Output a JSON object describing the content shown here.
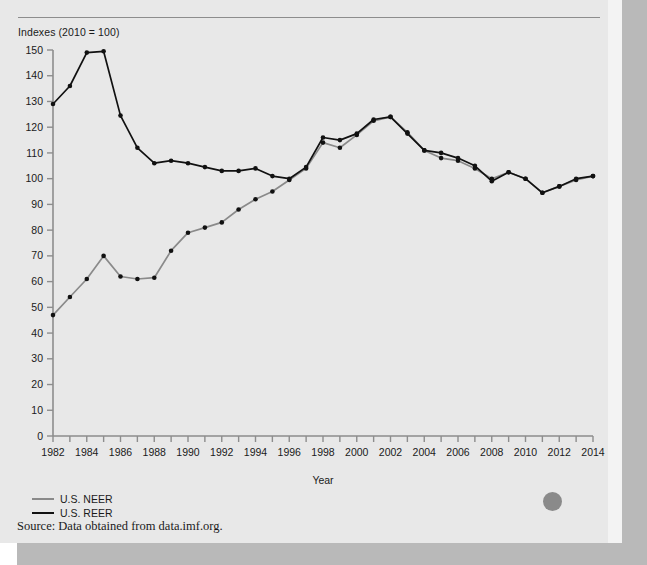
{
  "figure": {
    "axis_note": "Indexes (2010 = 100)",
    "source": "Source: Data obtained from data.imf.org."
  },
  "legend": {
    "position": "bottom-left",
    "items": [
      {
        "label": "U.S. NEER",
        "color": "#8a8a8a"
      },
      {
        "label": "U.S. REER",
        "color": "#111111"
      }
    ]
  },
  "chart_data": {
    "type": "line",
    "title": "Indexes (2010 = 100)",
    "subtitle": "",
    "xlabel": "Year",
    "ylabel": "Indexes (2010 = 100)",
    "xlim": [
      1982,
      2014
    ],
    "ylim": [
      0,
      150
    ],
    "ytick_step": 10,
    "xtick_step": 1,
    "xtick_label_step": 2,
    "grid": false,
    "markers": true,
    "yticks": [
      0,
      10,
      20,
      30,
      40,
      50,
      60,
      70,
      80,
      90,
      100,
      110,
      120,
      130,
      140,
      150
    ],
    "xticks": [
      1982,
      1983,
      1984,
      1985,
      1986,
      1987,
      1988,
      1989,
      1990,
      1991,
      1992,
      1993,
      1994,
      1995,
      1996,
      1997,
      1998,
      1999,
      2000,
      2001,
      2002,
      2003,
      2004,
      2005,
      2006,
      2007,
      2008,
      2009,
      2010,
      2011,
      2012,
      2013,
      2014
    ],
    "xtick_labels": [
      "1982",
      "",
      "1984",
      "",
      "1986",
      "",
      "1988",
      "",
      "1990",
      "",
      "1992",
      "",
      "1994",
      "",
      "1996",
      "",
      "1998",
      "",
      "2000",
      "",
      "2002",
      "",
      "2004",
      "",
      "2006",
      "",
      "2008",
      "",
      "2010",
      "",
      "2012",
      "",
      "2014"
    ],
    "x": [
      1982,
      1983,
      1984,
      1985,
      1986,
      1987,
      1988,
      1989,
      1990,
      1991,
      1992,
      1993,
      1994,
      1995,
      1996,
      1997,
      1998,
      1999,
      2000,
      2001,
      2002,
      2003,
      2004,
      2005,
      2006,
      2007,
      2008,
      2009,
      2010,
      2011,
      2012,
      2013,
      2014
    ],
    "series": [
      {
        "name": "U.S. NEER",
        "color": "#8a8a8a",
        "values": [
          47,
          54,
          61,
          70,
          62,
          61,
          61.5,
          72,
          79,
          81,
          83,
          88,
          92,
          95,
          99.5,
          104,
          114,
          112,
          117,
          122.5,
          124,
          118,
          111,
          108,
          107,
          104,
          100,
          102.5,
          100,
          94.5,
          97,
          99.5,
          101
        ]
      },
      {
        "name": "U.S. REER",
        "color": "#111111",
        "values": [
          129,
          136,
          149,
          149.5,
          124.5,
          112,
          106,
          107,
          106,
          104.5,
          103,
          103,
          104,
          101,
          100,
          104.5,
          116,
          115,
          117.5,
          123,
          124,
          117.5,
          111,
          110,
          108,
          105,
          99,
          102.5,
          100,
          94.5,
          97,
          100,
          101
        ]
      }
    ]
  },
  "axis": {
    "x_name": "Year"
  }
}
